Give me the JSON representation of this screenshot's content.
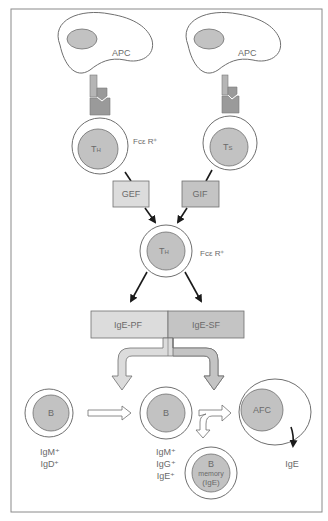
{
  "diagram": {
    "type": "immunology-pathway",
    "colors": {
      "frame": "#8a8a8a",
      "nucleus": "#c2c2c2",
      "cell_fill": "#ffffff",
      "cell_stroke": "#6f6f6f",
      "receptor_light": "#b5b5b5",
      "receptor_dark": "#9a9a9a",
      "box_light": "#dcdcdc",
      "box_dark": "#c4c4c4",
      "arrow": "#1a1a1a",
      "text": "#6a6a6a"
    },
    "apc_left": {
      "label": "APC"
    },
    "apc_right": {
      "label": "APC"
    },
    "th_top": {
      "label_main": "T",
      "label_sub": "H",
      "receptor_label": "Fcε R⁺"
    },
    "ts_top": {
      "label_main": "T",
      "label_sub": "S"
    },
    "gef_box": {
      "label": "GEF"
    },
    "gif_box": {
      "label": "GIF"
    },
    "th_mid": {
      "label_main": "T",
      "label_sub": "H",
      "receptor_label": "Fcε R⁺"
    },
    "ige_pf_box": {
      "label": "IgE-PF"
    },
    "ige_sf_box": {
      "label": "IgE-SF"
    },
    "b_cell_1": {
      "label": "B",
      "markers": [
        "IgM⁺",
        "IgD⁺"
      ]
    },
    "b_cell_2": {
      "label": "B",
      "markers": [
        "IgM⁺",
        "IgG⁺",
        "IgE⁺"
      ]
    },
    "b_memory": {
      "label": "B",
      "sub1": "memory",
      "sub2": "(IgE)"
    },
    "afc": {
      "label": "AFC",
      "output": "IgE"
    }
  }
}
